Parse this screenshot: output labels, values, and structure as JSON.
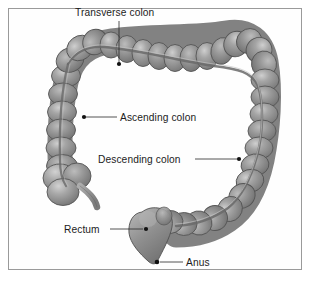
{
  "figure": {
    "background_color": "#ffffff",
    "border_color": "#9a9a9a",
    "organ_fill": "#8a8a8a",
    "organ_highlight": "#bdbdbd",
    "organ_outline": "#4f4f4f",
    "label_color": "#1c1c1c",
    "leader_color": "#2a2a2a"
  },
  "labels": [
    {
      "id": "transverse-colon",
      "text": "Transverse colon",
      "text_x": 75,
      "text_y": 16,
      "anchor": "start",
      "leader": "M119,21 L119,63",
      "dot_x": 119,
      "dot_y": 64
    },
    {
      "id": "ascending-colon",
      "text": "Ascending colon",
      "text_x": 120,
      "text_y": 121,
      "anchor": "start",
      "leader": "M117,117 L86,117",
      "dot_x": 84,
      "dot_y": 117
    },
    {
      "id": "descending-colon",
      "text": "Descending colon",
      "text_x": 98,
      "text_y": 163,
      "anchor": "start",
      "leader": "M195,159 L237,159",
      "dot_x": 239,
      "dot_y": 159
    },
    {
      "id": "rectum",
      "text": "Rectum",
      "text_x": 64,
      "text_y": 233,
      "anchor": "start",
      "leader": "M110,229 L143,229",
      "dot_x": 146,
      "dot_y": 229
    },
    {
      "id": "anus",
      "text": "Anus",
      "text_x": 186,
      "text_y": 266,
      "anchor": "start",
      "leader": "M183,262 L160,262",
      "dot_x": 157,
      "dot_y": 262
    }
  ],
  "structures": {
    "transverse_colon": "transverse-colon-segments",
    "ascending_colon": "ascending-colon-segments",
    "descending_colon": "descending-colon-segments",
    "sigmoid_colon": "sigmoid-colon-segments",
    "cecum": "cecum-shape",
    "appendix": "appendix-shape",
    "rectum": "rectum-shape",
    "taenia_coli": "taenia-coli-band"
  }
}
